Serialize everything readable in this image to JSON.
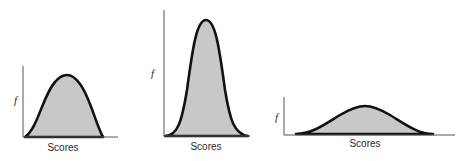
{
  "figure": {
    "panels": [
      {
        "id": "moderate",
        "y_label": "f",
        "x_label": "Scores"
      },
      {
        "id": "tall-narrow",
        "y_label": "f",
        "x_label": "Scores"
      },
      {
        "id": "flat-wide",
        "y_label": "f",
        "x_label": "Scores"
      }
    ],
    "colors": {
      "curve": "#111111",
      "fill": "#c8c8c8",
      "axis": "#555555"
    }
  }
}
